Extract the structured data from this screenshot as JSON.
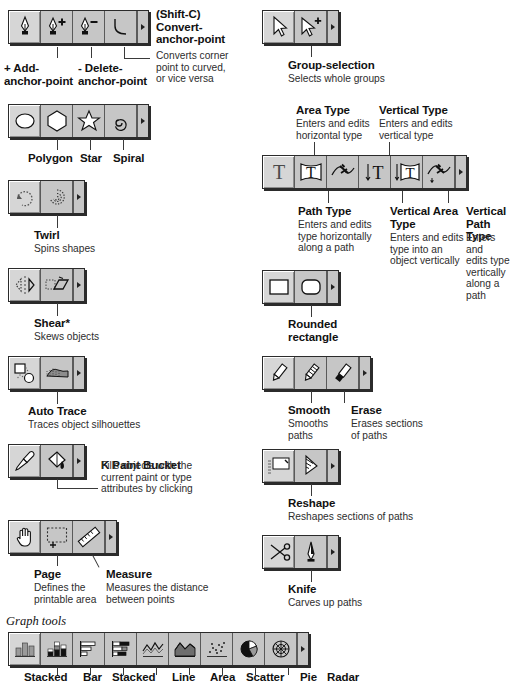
{
  "page": {
    "graph_tools_heading": "Graph tools"
  },
  "sections": [
    {
      "id": "pen-tools",
      "palette_icons": [
        "pen-icon",
        "add-anchor-point-icon",
        "delete-anchor-point-icon",
        "convert-anchor-point-icon"
      ],
      "labels": [
        {
          "name": "add-anchor-point",
          "title": "+ Add-\nanchor-point",
          "desc": ""
        },
        {
          "name": "delete-anchor-point",
          "title": "- Delete-\nanchor-point",
          "desc": ""
        },
        {
          "name": "convert-anchor-point",
          "title": "(Shift-C)\nConvert-\nanchor-point",
          "desc": "Converts corner\npoint to curved,\nor vice versa"
        }
      ]
    },
    {
      "id": "shape-tools",
      "palette_icons": [
        "ellipse-icon",
        "polygon-icon",
        "star-icon",
        "spiral-icon"
      ],
      "labels": [
        {
          "name": "polygon",
          "title": "Polygon",
          "desc": ""
        },
        {
          "name": "star",
          "title": "Star",
          "desc": ""
        },
        {
          "name": "spiral",
          "title": "Spiral",
          "desc": ""
        }
      ]
    },
    {
      "id": "twirl-tools",
      "palette_icons": [
        "rotate-icon",
        "twirl-icon"
      ],
      "labels": [
        {
          "name": "twirl",
          "title": "Twirl",
          "desc": "Spins shapes"
        }
      ]
    },
    {
      "id": "shear-tools",
      "palette_icons": [
        "reflect-icon",
        "shear-icon"
      ],
      "labels": [
        {
          "name": "shear",
          "title": "Shear*",
          "desc": "Skews objects"
        }
      ]
    },
    {
      "id": "autotrace-tools",
      "palette_icons": [
        "blend-icon",
        "auto-trace-icon"
      ],
      "labels": [
        {
          "name": "auto-trace",
          "title": "Auto Trace",
          "desc": "Traces object silhouettes"
        }
      ]
    },
    {
      "id": "paintbucket-tools",
      "palette_icons": [
        "eyedropper-icon",
        "paint-bucket-icon"
      ],
      "labels": [
        {
          "name": "paint-bucket",
          "title_prefix": "K",
          "title": " Paint Bucket",
          "desc": "Fills objects with the\ncurrent paint or type\nattributes by clicking"
        }
      ]
    },
    {
      "id": "page-measure-tools",
      "palette_icons": [
        "hand-icon",
        "page-icon",
        "measure-icon"
      ],
      "labels": [
        {
          "name": "page",
          "title": "Page",
          "desc": "Defines the\nprintable area"
        },
        {
          "name": "measure",
          "title": "Measure",
          "desc": "Measures the distance\nbetween points"
        }
      ]
    },
    {
      "id": "selection-tools",
      "palette_icons": [
        "direct-selection-icon",
        "group-selection-icon"
      ],
      "labels": [
        {
          "name": "group-selection",
          "title": "Group-selection",
          "desc": "Selects whole groups"
        }
      ]
    },
    {
      "id": "type-tools",
      "palette_icons": [
        "type-icon",
        "area-type-icon",
        "path-type-icon",
        "vertical-type-icon",
        "vertical-area-type-icon",
        "vertical-path-type-icon"
      ],
      "labels": [
        {
          "name": "area-type",
          "title": "Area Type",
          "desc": "Enters and edits\nhorizontal type"
        },
        {
          "name": "vertical-type",
          "title": "Vertical Type",
          "desc": "Enters and edits\nvertical type"
        },
        {
          "name": "path-type",
          "title": "Path Type",
          "desc": "Enters and edits\ntype horizontally\nalong a path"
        },
        {
          "name": "vertical-area-type",
          "title": "Vertical Area\nType",
          "desc": "Enters and edits\ntype into an\nobject vertically"
        },
        {
          "name": "vertical-path-type",
          "title": "Vertical\nPath Type",
          "desc": "Enters and\nedits type\nvertically\nalong a path"
        }
      ]
    },
    {
      "id": "rectangle-tools",
      "palette_icons": [
        "rectangle-icon",
        "rounded-rectangle-icon"
      ],
      "labels": [
        {
          "name": "rounded-rectangle",
          "title": "Rounded\nrectangle",
          "desc": ""
        }
      ]
    },
    {
      "id": "pencil-tools",
      "palette_icons": [
        "pencil-icon",
        "smooth-icon",
        "erase-icon"
      ],
      "labels": [
        {
          "name": "smooth",
          "title": "Smooth",
          "desc": "Smooths\npaths"
        },
        {
          "name": "erase",
          "title": "Erase",
          "desc": "Erases sections\nof paths"
        }
      ]
    },
    {
      "id": "reshape-tools",
      "palette_icons": [
        "scale-icon",
        "reshape-icon"
      ],
      "labels": [
        {
          "name": "reshape",
          "title": "Reshape",
          "desc": "Reshapes sections of paths"
        }
      ]
    },
    {
      "id": "knife-tools",
      "palette_icons": [
        "scissors-icon",
        "knife-icon"
      ],
      "labels": [
        {
          "name": "knife",
          "title": "Knife",
          "desc": "Carves up paths"
        }
      ]
    },
    {
      "id": "graph-tools",
      "palette_icons": [
        "column-graph-icon",
        "stacked-column-graph-icon",
        "bar-graph-icon",
        "stacked-bar-graph-icon",
        "line-graph-icon",
        "area-graph-icon",
        "scatter-graph-icon",
        "pie-graph-icon",
        "radar-graph-icon"
      ],
      "labels": [
        {
          "name": "stacked-column",
          "title": "Stacked",
          "desc": ""
        },
        {
          "name": "bar",
          "title": "Bar",
          "desc": ""
        },
        {
          "name": "stacked-bar",
          "title": "Stacked",
          "desc": ""
        },
        {
          "name": "line",
          "title": "Line",
          "desc": ""
        },
        {
          "name": "area",
          "title": "Area",
          "desc": ""
        },
        {
          "name": "scatter",
          "title": "Scatter",
          "desc": ""
        },
        {
          "name": "pie",
          "title": "Pie",
          "desc": ""
        },
        {
          "name": "radar",
          "title": "Radar",
          "desc": ""
        }
      ]
    }
  ],
  "colors": {
    "palette_face": "#c6c6c6",
    "palette_border": "#2b2b2b",
    "selected_cell": "#d6d6d6",
    "text": "#1a1a1a"
  }
}
